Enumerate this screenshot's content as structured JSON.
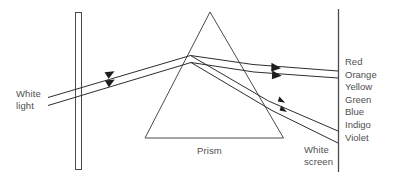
{
  "figure": {
    "type": "optics-ray-diagram",
    "background_color": "#ffffff",
    "line_color": "#3a3a3a",
    "text_color": "#4f4f4f"
  },
  "labels": {
    "white_light": {
      "line1": "White",
      "line2": "light"
    },
    "prism": "Prism",
    "white_screen": {
      "line1": "White",
      "line2": "screen"
    }
  },
  "spectrum": {
    "items": [
      {
        "name": "Red"
      },
      {
        "name": "Orange"
      },
      {
        "name": "Yellow"
      },
      {
        "name": "Green"
      },
      {
        "name": "Blue"
      },
      {
        "name": "Indigo"
      },
      {
        "name": "Violet"
      }
    ]
  },
  "components": {
    "slit_barrier": "vertical-slit-barrier",
    "prism_shape": "triangle",
    "screen": "vertical-screen-line",
    "incident_beam": "white-light-beam",
    "emergent_beams": "dispersed-spectrum-beams"
  }
}
